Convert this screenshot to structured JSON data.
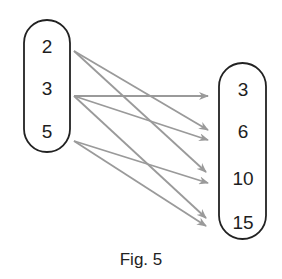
{
  "figure": {
    "caption": "Fig. 5",
    "left_set": {
      "elements": [
        "2",
        "3",
        "5"
      ]
    },
    "right_set": {
      "elements": [
        "3",
        "6",
        "10",
        "15"
      ]
    },
    "arrows": [
      {
        "from": "2",
        "to": "6"
      },
      {
        "from": "2",
        "to": "10"
      },
      {
        "from": "3",
        "to": "3"
      },
      {
        "from": "3",
        "to": "6"
      },
      {
        "from": "3",
        "to": "15"
      },
      {
        "from": "5",
        "to": "10"
      },
      {
        "from": "5",
        "to": "15"
      }
    ],
    "colors": {
      "oval_stroke": "#222222",
      "arrow": "#9a9a9a",
      "text": "#1e1e1e",
      "background": "#ffffff"
    }
  }
}
